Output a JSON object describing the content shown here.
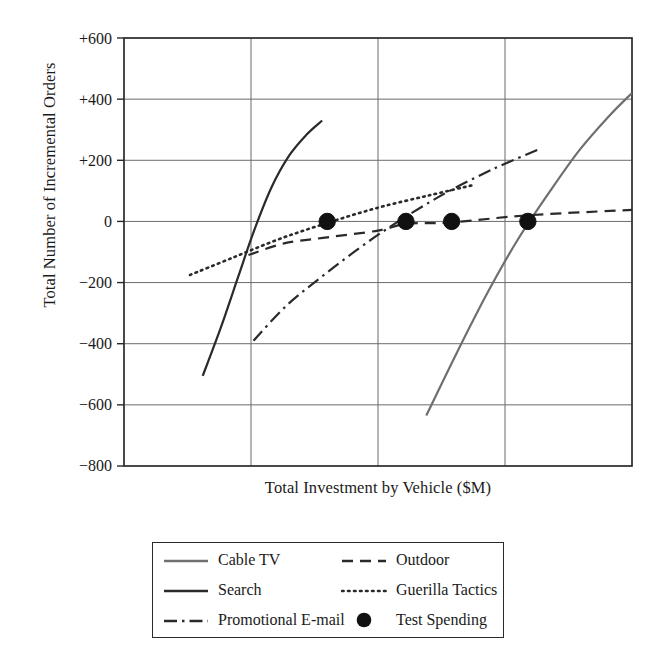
{
  "chart_data": {
    "type": "line",
    "title": "",
    "xlabel": "Total Investment by Vehicle ($M)",
    "ylabel": "Total Number of Incremental Orders",
    "xlim": [
      0,
      4
    ],
    "ylim": [
      -800,
      600
    ],
    "yticks": [
      600,
      400,
      200,
      0,
      -200,
      -400,
      -600,
      -800
    ],
    "ytick_labels": [
      "+600",
      "+400",
      "+200",
      "0",
      "−200",
      "−400",
      "−600",
      "−800"
    ],
    "xticks": [
      0,
      1,
      2,
      3,
      4
    ],
    "xtick_labels": [
      "",
      "",
      "",
      "",
      ""
    ],
    "grid": true,
    "legend_position": "below-plot",
    "series": [
      {
        "name": "Cable TV",
        "style": "solid",
        "color": "#6f6f6f",
        "points": [
          {
            "x": 2.38,
            "y": -635
          },
          {
            "x": 2.62,
            "y": -430
          },
          {
            "x": 2.86,
            "y": -235
          },
          {
            "x": 3.1,
            "y": -60
          },
          {
            "x": 3.34,
            "y": 90
          },
          {
            "x": 3.58,
            "y": 230
          },
          {
            "x": 3.82,
            "y": 345
          },
          {
            "x": 4.0,
            "y": 420
          }
        ]
      },
      {
        "name": "Search",
        "style": "solid",
        "color": "#2a2a2a",
        "points": [
          {
            "x": 0.62,
            "y": -505
          },
          {
            "x": 0.76,
            "y": -350
          },
          {
            "x": 0.9,
            "y": -180
          },
          {
            "x": 1.02,
            "y": -35
          },
          {
            "x": 1.16,
            "y": 110
          },
          {
            "x": 1.3,
            "y": 215
          },
          {
            "x": 1.44,
            "y": 285
          },
          {
            "x": 1.56,
            "y": 330
          }
        ]
      },
      {
        "name": "Promotional E-mail",
        "style": "dashdot",
        "color": "#2a2a2a",
        "points": [
          {
            "x": 1.02,
            "y": -390
          },
          {
            "x": 1.28,
            "y": -275
          },
          {
            "x": 1.56,
            "y": -180
          },
          {
            "x": 1.86,
            "y": -85
          },
          {
            "x": 2.16,
            "y": 0
          },
          {
            "x": 2.52,
            "y": 90
          },
          {
            "x": 2.9,
            "y": 170
          },
          {
            "x": 3.26,
            "y": 235
          }
        ]
      },
      {
        "name": "Outdoor",
        "style": "dashed",
        "color": "#2a2a2a",
        "points": [
          {
            "x": 0.98,
            "y": -110
          },
          {
            "x": 1.26,
            "y": -72
          },
          {
            "x": 1.6,
            "y": -52
          },
          {
            "x": 2.0,
            "y": -30
          },
          {
            "x": 2.22,
            "y": -8
          },
          {
            "x": 2.58,
            "y": -3
          },
          {
            "x": 3.18,
            "y": 20
          },
          {
            "x": 4.0,
            "y": 38
          }
        ]
      },
      {
        "name": "Guerilla Tactics",
        "style": "dotted",
        "color": "#2a2a2a",
        "points": [
          {
            "x": 0.52,
            "y": -175
          },
          {
            "x": 0.86,
            "y": -118
          },
          {
            "x": 1.22,
            "y": -58
          },
          {
            "x": 1.6,
            "y": -5
          },
          {
            "x": 2.0,
            "y": 45
          },
          {
            "x": 2.4,
            "y": 85
          },
          {
            "x": 2.74,
            "y": 118
          }
        ]
      }
    ],
    "markers": {
      "name": "Test Spending",
      "style": "filled-circle",
      "color": "#111111",
      "points": [
        {
          "x": 1.6,
          "y": 0
        },
        {
          "x": 2.22,
          "y": 0
        },
        {
          "x": 2.58,
          "y": 0
        },
        {
          "x": 3.18,
          "y": 0
        }
      ]
    }
  },
  "legend": {
    "entries": [
      {
        "label": "Cable TV",
        "style": "solid",
        "color": "#6f6f6f"
      },
      {
        "label": "Outdoor",
        "style": "dashed",
        "color": "#2a2a2a"
      },
      {
        "label": "Search",
        "style": "solid",
        "color": "#2a2a2a"
      },
      {
        "label": "Guerilla Tactics",
        "style": "dotted",
        "color": "#2a2a2a"
      },
      {
        "label": "Promotional E-mail",
        "style": "dashdot",
        "color": "#2a2a2a"
      },
      {
        "label": "Test Spending",
        "style": "filled-circle",
        "color": "#111111"
      }
    ]
  },
  "colors": {
    "axis": "#2a2a2a",
    "grid": "#6b6b6b",
    "text": "#1a1a1a",
    "cable_tv": "#6f6f6f",
    "marker": "#111111",
    "background": "#ffffff"
  }
}
